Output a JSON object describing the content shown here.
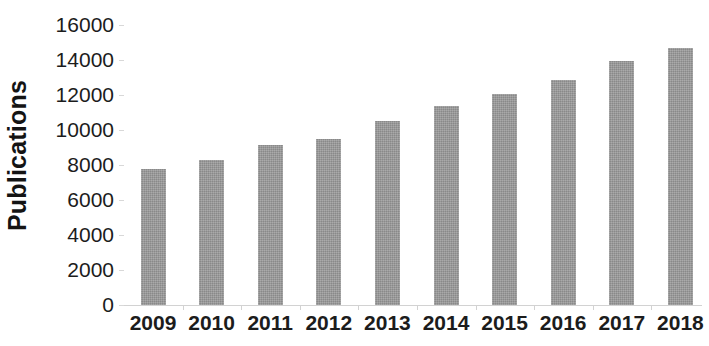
{
  "chart_data": {
    "type": "bar",
    "title": "",
    "subtitle": "",
    "xlabel": "",
    "ylabel": "Publications",
    "categories": [
      "2009",
      "2010",
      "2011",
      "2012",
      "2013",
      "2014",
      "2015",
      "2016",
      "2017",
      "2018"
    ],
    "values": [
      7800,
      8300,
      9150,
      9500,
      10500,
      11350,
      12050,
      12850,
      13950,
      14700
    ],
    "series": [
      {
        "name": "Publications",
        "values": [
          7800,
          8300,
          9150,
          9500,
          10500,
          11350,
          12050,
          12850,
          13950,
          14700
        ]
      }
    ],
    "ylim": [
      0,
      16000
    ],
    "y_ticks": [
      0,
      2000,
      4000,
      6000,
      8000,
      10000,
      12000,
      14000,
      16000
    ],
    "y_tick_labels": [
      "0",
      "2000",
      "4000",
      "6000",
      "8000",
      "10000",
      "12000",
      "14000",
      "16000"
    ],
    "x_tick_labels": [
      "2009",
      "2010",
      "2011",
      "2012",
      "2013",
      "2014",
      "2015",
      "2016",
      "2017",
      "2018"
    ],
    "grid": false,
    "legend": false,
    "legend_position": "none",
    "annotations": [],
    "bar_color": "#979797",
    "axis_color": "#d4d4d4",
    "text_color": "#1c1c1c",
    "background_color": "#ffffff"
  }
}
